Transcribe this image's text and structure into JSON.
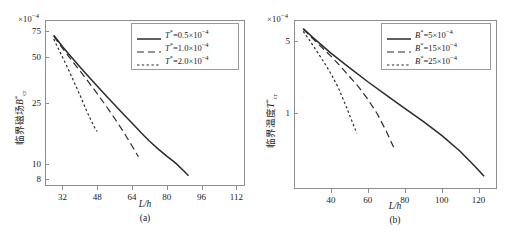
{
  "figure": {
    "title": "",
    "panels": [
      "a",
      "b"
    ]
  },
  "panel_a": {
    "caption": "(a)",
    "xlabel": "L/h",
    "ylabel_cjk": "临界磁场",
    "ylabel_sym": "B",
    "ylabel_sup": "*",
    "ylabel_sub": "cr",
    "multiplier": "×10",
    "multiplier_exp": "−4",
    "xticks": [
      "32",
      "48",
      "64",
      "80",
      "96",
      "112"
    ],
    "yticks": [
      "75",
      "50",
      "25",
      "10",
      "8"
    ],
    "legend": [
      {
        "label_sym": "T",
        "label_sup": "*",
        "label_rest": "=0.5×10",
        "label_exp": "−4",
        "style": "solid"
      },
      {
        "label_sym": "T",
        "label_sup": "*",
        "label_rest": "=1.0×10",
        "label_exp": "−4",
        "style": "dashed"
      },
      {
        "label_sym": "T",
        "label_sup": "*",
        "label_rest": "=2.0×10",
        "label_exp": "−4",
        "style": "dotted"
      }
    ]
  },
  "panel_b": {
    "caption": "(b)",
    "xlabel": "L/h",
    "ylabel_cjk": "临界温度",
    "ylabel_sym": "T",
    "ylabel_sup": "*",
    "ylabel_sub": "cr",
    "multiplier": "×10",
    "multiplier_exp": "−4",
    "xticks": [
      "40",
      "60",
      "80",
      "100",
      "120"
    ],
    "yticks": [
      "5",
      "1"
    ],
    "legend": [
      {
        "label_sym": "B",
        "label_sup": "*",
        "label_rest": "=5×10",
        "label_exp": "−4",
        "style": "solid"
      },
      {
        "label_sym": "B",
        "label_sup": "*",
        "label_rest": "=15×10",
        "label_exp": "−4",
        "style": "dashed"
      },
      {
        "label_sym": "B",
        "label_sup": "*",
        "label_rest": "=25×10",
        "label_exp": "−4",
        "style": "dotted"
      }
    ]
  },
  "chart_data": [
    {
      "type": "line",
      "panel": "a",
      "title": "",
      "xlabel": "L/h",
      "ylabel": "临界磁场 B*_cr (×10^-4)",
      "xscale": "linear",
      "yscale": "log",
      "xlim": [
        24,
        116
      ],
      "ylim": [
        7.2,
        88
      ],
      "grid": false,
      "legend_position": "upper right",
      "xticks": [
        32,
        48,
        64,
        80,
        96,
        112
      ],
      "yticks": [
        75,
        50,
        25,
        10,
        8
      ],
      "series": [
        {
          "name": "T*=0.5×10^-4",
          "style": "solid",
          "x": [
            28,
            32,
            36,
            40,
            44,
            48,
            52,
            56,
            60,
            64,
            68,
            72,
            76,
            80,
            84,
            88,
            90
          ],
          "y": [
            70.0,
            59.0,
            50.5,
            43.5,
            37.5,
            32.5,
            28.2,
            24.5,
            21.3,
            18.6,
            16.2,
            14.2,
            12.6,
            11.3,
            10.2,
            9.0,
            8.4
          ]
        },
        {
          "name": "T*=1.0×10^-4",
          "style": "dashed",
          "x": [
            28,
            32,
            36,
            40,
            44,
            48,
            52,
            56,
            60,
            64,
            66,
            67
          ],
          "y": [
            69.0,
            57.5,
            48.5,
            41.0,
            34.6,
            29.0,
            24.2,
            20.0,
            16.4,
            13.2,
            11.8,
            11.2
          ]
        },
        {
          "name": "T*=2.0×10^-4",
          "style": "dotted",
          "x": [
            28,
            31,
            34,
            37,
            40,
            43,
            45,
            47,
            48
          ],
          "y": [
            66.0,
            54.0,
            44.0,
            35.5,
            28.5,
            22.6,
            19.6,
            17.2,
            16.4
          ]
        }
      ]
    },
    {
      "type": "line",
      "panel": "b",
      "title": "",
      "xlabel": "L/h",
      "ylabel": "临界温度 T*_cr (×10^-4)",
      "xscale": "linear",
      "yscale": "log",
      "xlim": [
        20,
        130
      ],
      "ylim": [
        0.18,
        8.0
      ],
      "grid": false,
      "legend_position": "upper right",
      "xticks": [
        40,
        60,
        80,
        100,
        120
      ],
      "yticks": [
        5,
        1
      ],
      "series": [
        {
          "name": "B*=5×10^-4",
          "style": "solid",
          "x": [
            25,
            30,
            40,
            50,
            60,
            70,
            80,
            90,
            100,
            110,
            118,
            123
          ],
          "y": [
            6.6,
            5.45,
            3.8,
            2.75,
            2.0,
            1.48,
            1.1,
            0.82,
            0.6,
            0.42,
            0.3,
            0.24
          ]
        },
        {
          "name": "B*=15×10^-4",
          "style": "dashed",
          "x": [
            25,
            30,
            40,
            45,
            50,
            55,
            60,
            65,
            70,
            74
          ],
          "y": [
            6.5,
            5.3,
            3.55,
            2.85,
            2.25,
            1.78,
            1.35,
            0.98,
            0.66,
            0.46
          ]
        },
        {
          "name": "B*=25×10^-4",
          "style": "dotted",
          "x": [
            25,
            28,
            32,
            36,
            40,
            44,
            48,
            51,
            53,
            54
          ],
          "y": [
            6.2,
            5.2,
            4.05,
            3.15,
            2.4,
            1.75,
            1.18,
            0.86,
            0.7,
            0.63
          ]
        }
      ]
    }
  ]
}
